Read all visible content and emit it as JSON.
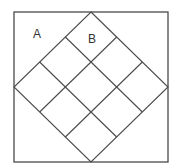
{
  "diagram": {
    "type": "geometry",
    "labels": [
      {
        "id": "A",
        "text": "A",
        "region": "top-left corner triangle outside diamond",
        "x": 37,
        "y": 38
      },
      {
        "id": "B",
        "text": "B",
        "region": "top cell of diamond grid",
        "x": 92,
        "y": 43
      }
    ],
    "outer_square": {
      "x": 14,
      "y": 12,
      "width": 154,
      "height": 150
    },
    "diamond": {
      "vertices": {
        "top": [
          91,
          12
        ],
        "right": [
          168,
          87
        ],
        "bottom": [
          91,
          162
        ],
        "left": [
          14,
          87
        ]
      },
      "grid": "3x3"
    },
    "colors": {
      "stroke": "#4a4a4a",
      "label": "#333333",
      "background": "#ffffff"
    }
  }
}
